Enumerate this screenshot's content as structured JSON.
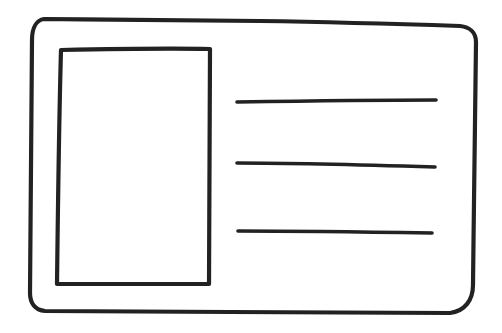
{
  "diagram": {
    "type": "wireframe-sketch",
    "stroke_color": "#222222",
    "background": "#ffffff",
    "card": {
      "shape": "rounded-rectangle",
      "image_placeholder": {
        "shape": "rectangle",
        "position": "left"
      },
      "text_lines": [
        {
          "index": 1,
          "position": "top"
        },
        {
          "index": 2,
          "position": "middle"
        },
        {
          "index": 3,
          "position": "bottom"
        }
      ]
    }
  }
}
